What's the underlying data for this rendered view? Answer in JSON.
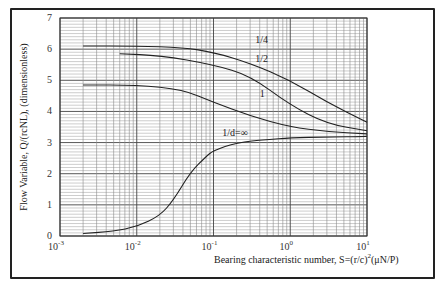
{
  "chart_data": {
    "type": "line",
    "title": "",
    "xlabel": "Bearing characteristic number, S=(r/c)²(μN/P)",
    "ylabel": "Flow Variable, Q/(rcNL), (dimensionless)",
    "xscale": "log",
    "xlim": [
      0.001,
      10
    ],
    "ylim": [
      0,
      7
    ],
    "grid": true,
    "x_ticks": [
      "10^-3",
      "10^-2",
      "10^-1",
      "10^0",
      "10^1"
    ],
    "y_ticks": [
      0,
      1,
      2,
      3,
      4,
      5,
      6,
      7
    ],
    "series": [
      {
        "name": "1/4",
        "label_pos": [
          0.35,
          6.2
        ],
        "x": [
          0.002,
          0.01,
          0.04,
          0.1,
          0.3,
          1,
          3,
          10
        ],
        "y": [
          6.1,
          6.1,
          6.05,
          5.9,
          5.55,
          5.0,
          4.3,
          3.65
        ]
      },
      {
        "name": "1/2",
        "label_pos": [
          0.35,
          5.6
        ],
        "x": [
          0.006,
          0.02,
          0.1,
          0.3,
          1,
          3,
          10
        ],
        "y": [
          5.85,
          5.8,
          5.5,
          5.15,
          4.2,
          3.6,
          3.38
        ]
      },
      {
        "name": "1",
        "label_pos": [
          0.4,
          4.45
        ],
        "x": [
          0.002,
          0.01,
          0.04,
          0.1,
          0.3,
          1,
          3,
          10
        ],
        "y": [
          4.85,
          4.85,
          4.7,
          4.3,
          3.85,
          3.5,
          3.35,
          3.28
        ]
      },
      {
        "name": "1/d=∞",
        "label_pos": [
          0.13,
          3.22
        ],
        "x": [
          0.002,
          0.005,
          0.01,
          0.02,
          0.03,
          0.05,
          0.08,
          0.1,
          0.2,
          0.5,
          1,
          3,
          10
        ],
        "y": [
          0.08,
          0.15,
          0.3,
          0.65,
          1.15,
          2.05,
          2.55,
          2.75,
          3.0,
          3.1,
          3.15,
          3.18,
          3.2
        ]
      }
    ]
  },
  "labels": {
    "xlabel_main": "Bearing characteristic number, S=(r/c)",
    "xlabel_sup": "2",
    "xlabel_tail": "(μN/P)",
    "ylabel": "Flow Variable, Q/(rcNL), (dimensionless)",
    "y_tick_labels": [
      "0",
      "1",
      "2",
      "3",
      "4",
      "5",
      "6",
      "7"
    ],
    "x_tick_base": "10",
    "x_tick_exps": [
      "-3",
      "-2",
      "-1",
      "0",
      "1"
    ]
  }
}
